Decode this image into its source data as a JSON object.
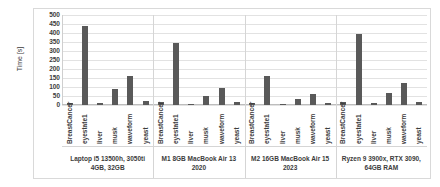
{
  "chart_data": {
    "type": "bar",
    "title": "",
    "xlabel": "",
    "ylabel": "Time [s]",
    "ylim": [
      0,
      500
    ],
    "ytick_step": 50,
    "yticks": [
      "500",
      "450",
      "400",
      "350",
      "300",
      "250",
      "200",
      "150",
      "100",
      "50",
      "0"
    ],
    "grid": true,
    "legend": "none",
    "bar_color": "#595959",
    "grid_color": "#e2e2e2",
    "categories": [
      "BreastCancer",
      "eyestate1",
      "liver",
      "musk",
      "waveform",
      "yeast"
    ],
    "groups": [
      {
        "label": "Laptop i5 13500h, 3050ti 4GB, 32GB",
        "values": [
          12,
          440,
          10,
          90,
          160,
          20
        ]
      },
      {
        "label": "M1 8GB MacBook Air 13 2020",
        "values": [
          18,
          345,
          8,
          48,
          95,
          14
        ]
      },
      {
        "label": "M2 16GB MacBook Air 15 2023",
        "values": [
          10,
          160,
          6,
          35,
          60,
          12
        ]
      },
      {
        "label": "Ryzen 9 3900x, RTX 3090, 64GB RAM",
        "values": [
          14,
          395,
          9,
          65,
          120,
          18
        ]
      }
    ]
  }
}
